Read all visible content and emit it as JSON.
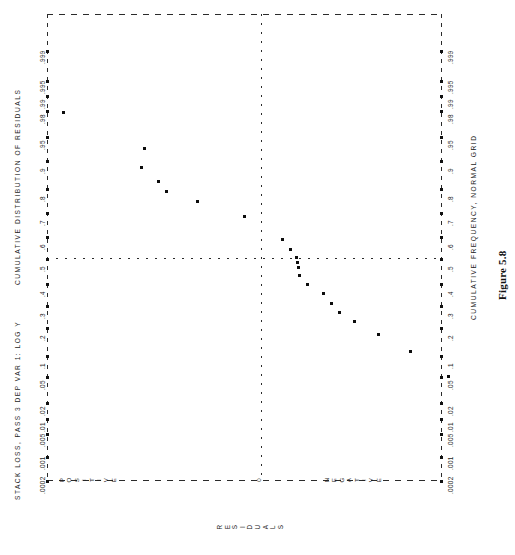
{
  "figure": {
    "caption": "Figure 5.8",
    "header": "STACK LOSS, PASS 3   DEP VAR 1: LOG Y",
    "left_axis_title": "CUMULATIVE DISTRIBUTION OF RESIDUALS",
    "right_axis_title": "CUMULATIVE FREQUENCY, NORMAL GRID",
    "bottom_axis_label": "RESIDUALS",
    "category_labels": [
      "POSITIVE",
      "0",
      "NEGATIVE"
    ]
  },
  "chart_data": {
    "type": "scatter",
    "title": "STACK LOSS, PASS 3   DEP VAR 1: LOG Y",
    "subtitle": "Figure 5.8",
    "xlabel": "RESIDUALS",
    "ylabel": "CUMULATIVE DISTRIBUTION OF RESIDUALS",
    "ylabel_secondary": "CUMULATIVE FREQUENCY, NORMAL GRID",
    "orientation": "probability axis vertical (plot rotated 90 degrees)",
    "grid": true,
    "legend": "none",
    "y_tick_labels": [
      ".0002",
      ".001",
      ".005",
      ".01",
      ".02",
      ".05",
      ".1",
      ".2",
      ".3",
      ".4",
      ".5",
      ".6",
      ".7",
      ".8",
      ".9",
      ".95",
      ".98",
      ".99",
      ".995",
      ".999"
    ],
    "y_tick_values": [
      0.0002,
      0.001,
      0.005,
      0.01,
      0.02,
      0.05,
      0.1,
      0.2,
      0.3,
      0.4,
      0.5,
      0.6,
      0.7,
      0.8,
      0.9,
      0.95,
      0.98,
      0.99,
      0.995,
      0.999
    ],
    "x_tick_labels": [
      "POSITIVE",
      "0",
      "NEGATIVE"
    ],
    "reference_lines": [
      {
        "name": "median-line",
        "axis": "cumulative",
        "value": 0.5,
        "style": "dotted"
      },
      {
        "name": "zero-residual-line",
        "axis": "residual",
        "value": 0,
        "style": "dashed"
      }
    ],
    "points": [
      {
        "cum_prob": 0.963,
        "residual_side": "positive",
        "x_px": 62,
        "y_px": 111
      },
      {
        "cum_prob": 0.881,
        "residual_side": "positive",
        "x_px": 143,
        "y_px": 147
      },
      {
        "cum_prob": 0.845,
        "residual_side": "positive",
        "x_px": 140,
        "y_px": 166
      },
      {
        "cum_prob": 0.795,
        "residual_side": "positive",
        "x_px": 157,
        "y_px": 180
      },
      {
        "cum_prob": 0.758,
        "residual_side": "positive",
        "x_px": 165,
        "y_px": 190
      },
      {
        "cum_prob": 0.69,
        "residual_side": "positive",
        "x_px": 196,
        "y_px": 200
      },
      {
        "cum_prob": 0.62,
        "residual_side": "positive",
        "x_px": 243,
        "y_px": 215
      },
      {
        "cum_prob": 0.535,
        "residual_side": "positive",
        "x_px": 281,
        "y_px": 238
      },
      {
        "cum_prob": 0.512,
        "residual_side": "positive",
        "x_px": 289,
        "y_px": 248
      },
      {
        "cum_prob": 0.495,
        "residual_side": "negative",
        "x_px": 295,
        "y_px": 256
      },
      {
        "cum_prob": 0.472,
        "residual_side": "negative",
        "x_px": 296,
        "y_px": 261
      },
      {
        "cum_prob": 0.452,
        "residual_side": "negative",
        "x_px": 297,
        "y_px": 266
      },
      {
        "cum_prob": 0.425,
        "residual_side": "negative",
        "x_px": 298,
        "y_px": 274
      },
      {
        "cum_prob": 0.382,
        "residual_side": "negative",
        "x_px": 306,
        "y_px": 283
      },
      {
        "cum_prob": 0.33,
        "residual_side": "negative",
        "x_px": 322,
        "y_px": 292
      },
      {
        "cum_prob": 0.288,
        "residual_side": "negative",
        "x_px": 330,
        "y_px": 302
      },
      {
        "cum_prob": 0.245,
        "residual_side": "negative",
        "x_px": 338,
        "y_px": 311
      },
      {
        "cum_prob": 0.198,
        "residual_side": "negative",
        "x_px": 353,
        "y_px": 320
      },
      {
        "cum_prob": 0.135,
        "residual_side": "negative",
        "x_px": 377,
        "y_px": 333
      },
      {
        "cum_prob": 0.082,
        "residual_side": "negative",
        "x_px": 409,
        "y_px": 350
      },
      {
        "cum_prob": 0.022,
        "residual_side": "negative",
        "x_px": 447,
        "y_px": 375
      }
    ]
  },
  "axis": {
    "ticks": [
      {
        "label": ".0002",
        "y": 480
      },
      {
        "label": ".001",
        "y": 456
      },
      {
        "label": ".005",
        "y": 433
      },
      {
        "label": ".01",
        "y": 418
      },
      {
        "label": ".02",
        "y": 402
      },
      {
        "label": ".05",
        "y": 376
      },
      {
        "label": ".1",
        "y": 355
      },
      {
        "label": ".2",
        "y": 327
      },
      {
        "label": ".3",
        "y": 305
      },
      {
        "label": ".4",
        "y": 283
      },
      {
        "label": ".5",
        "y": 258
      },
      {
        "label": ".6",
        "y": 236
      },
      {
        "label": ".7",
        "y": 212
      },
      {
        "label": ".8",
        "y": 188
      },
      {
        "label": ".9",
        "y": 160
      },
      {
        "label": ".95",
        "y": 136
      },
      {
        "label": ".98",
        "y": 110
      },
      {
        "label": ".99",
        "y": 95
      },
      {
        "label": ".995",
        "y": 80
      },
      {
        "label": ".999",
        "y": 50
      }
    ]
  }
}
